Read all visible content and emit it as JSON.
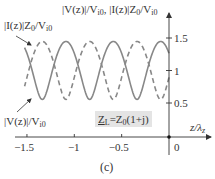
{
  "figure": {
    "panel_label": "(c)",
    "y_axis_label_parts": [
      "|V(z)|/V",
      "i0",
      ", |I(z)|Z",
      "0",
      "/V",
      "i0"
    ],
    "x_axis_label_parts": [
      "z/λ",
      "z"
    ],
    "annotation_current_parts": [
      "|I(z)|Z",
      "0",
      "/V",
      "i0"
    ],
    "annotation_voltage_parts": [
      "|V(z)|/V",
      "i0"
    ],
    "load_label_parts": [
      "Z",
      "L",
      "=Z",
      "0",
      "(1+j)"
    ],
    "y_ticks": [
      {
        "value": 1.5,
        "label": "1.5"
      },
      {
        "value": 1,
        "label": "1"
      },
      {
        "value": 0.5,
        "label": "0.5"
      }
    ],
    "x_ticks": [
      {
        "value": -1.5,
        "label": "−1.5"
      },
      {
        "value": -1,
        "label": "−1"
      },
      {
        "value": -0.5,
        "label": "−0.5"
      },
      {
        "value": 0,
        "label": "0"
      }
    ],
    "colors": {
      "curve": "#888888",
      "axis": "#333333",
      "load_box": "#e4e4e4"
    }
  },
  "chart_data": {
    "type": "line",
    "title": "",
    "xlabel": "z/λz",
    "ylabel": "|V(z)|/Vi0, |I(z)|Z0/Vi0",
    "xlim": [
      -1.55,
      0.25
    ],
    "ylim": [
      0,
      1.8
    ],
    "grid": false,
    "annotations": [
      "ZL = Z0(1+j)",
      "(c)"
    ],
    "x_step": -0.025,
    "x_start": 0,
    "n_points": 62,
    "period_values": {
      "voltage": [
        1.2649,
        1.3519,
        1.4121,
        1.443,
        1.4435,
        1.4142,
        1.3554,
        1.2696,
        1.1604,
        1.0328,
        0.8944,
        0.7566,
        0.6373,
        0.5637,
        0.5628,
        0.6325,
        0.7502,
        0.8877,
        1.0264,
        1.1547
      ],
      "current": [
        0.8944,
        0.7566,
        0.6373,
        0.5637,
        0.5628,
        0.6325,
        0.7502,
        0.8877,
        1.0264,
        1.1547,
        1.2649,
        1.3519,
        1.4121,
        1.443,
        1.4435,
        1.4142,
        1.3554,
        1.2696,
        1.1604,
        1.0328
      ]
    },
    "series": [
      {
        "name": "|V(z)|/Vi0",
        "style": "solid"
      },
      {
        "name": "|I(z)|Z0/Vi0",
        "style": "dashed"
      }
    ]
  }
}
